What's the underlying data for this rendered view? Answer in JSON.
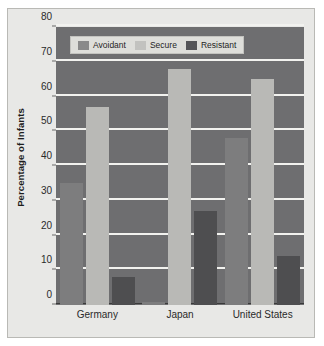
{
  "chart_data": {
    "type": "bar",
    "title": "",
    "xlabel": "",
    "ylabel": "Percentage of Infants",
    "categories": [
      "Germany",
      "Japan",
      "United States"
    ],
    "series": [
      {
        "name": "Avoidant",
        "color": "#7d7d7e",
        "values": [
          35,
          1,
          48
        ]
      },
      {
        "name": "Secure",
        "color": "#b9b9b6",
        "values": [
          57,
          68,
          65
        ]
      },
      {
        "name": "Resistant",
        "color": "#4e4e50",
        "values": [
          8,
          27,
          14
        ]
      }
    ],
    "ylim": [
      0,
      80
    ],
    "ytick_step": 10,
    "yticks": [
      "0",
      "10",
      "20",
      "30",
      "40",
      "50",
      "60",
      "70",
      "80"
    ],
    "grid": true,
    "legend_position": "top-left",
    "plot_background": "#6e6e70",
    "gridline_color": "#f2f2ef",
    "figure_background": "#e8e8e6"
  }
}
